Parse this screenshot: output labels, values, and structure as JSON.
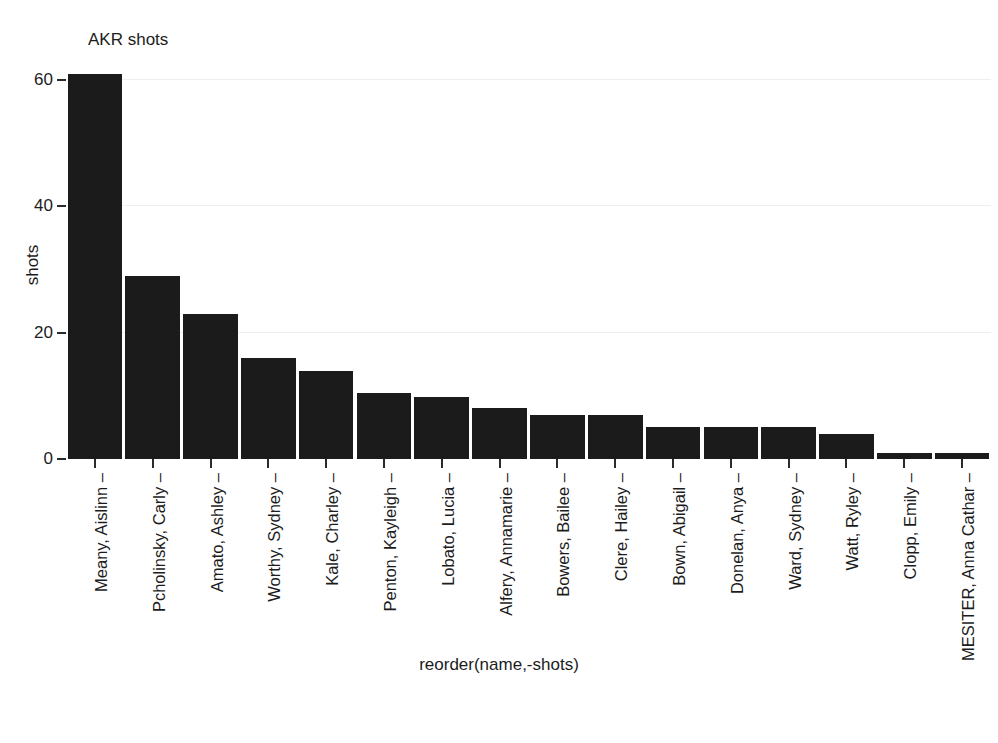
{
  "chart_data": {
    "type": "bar",
    "title": "AKR shots",
    "xlabel": "reorder(name,-shots)",
    "ylabel": "shots",
    "categories": [
      "Meany, Aislinn",
      "Pcholinsky, Carly",
      "Amato, Ashley",
      "Worthy, Sydney",
      "Kale, Charley",
      "Penton, Kayleigh",
      "Lobato, Lucia",
      "Alfery, Annamarie",
      "Bowers, Bailee",
      "Clere, Hailey",
      "Bown, Abigail",
      "Donelan, Anya",
      "Ward, Sydney",
      "Watt, Ryley",
      "Clopp, Emily",
      "MESITER, Anna Cathar"
    ],
    "values": [
      61,
      29,
      23,
      16,
      14,
      10.5,
      9.8,
      8,
      7,
      7,
      5,
      5,
      5,
      4,
      1,
      1
    ],
    "ylim": [
      0,
      64
    ],
    "yticks": [
      0,
      20,
      40,
      60
    ],
    "ytick_labels": [
      "0",
      "20",
      "40",
      "60"
    ],
    "grid": true,
    "legend": "none",
    "bar_color": "#1b1b1b",
    "grid_color": "#efefef",
    "background": "#ffffff"
  }
}
